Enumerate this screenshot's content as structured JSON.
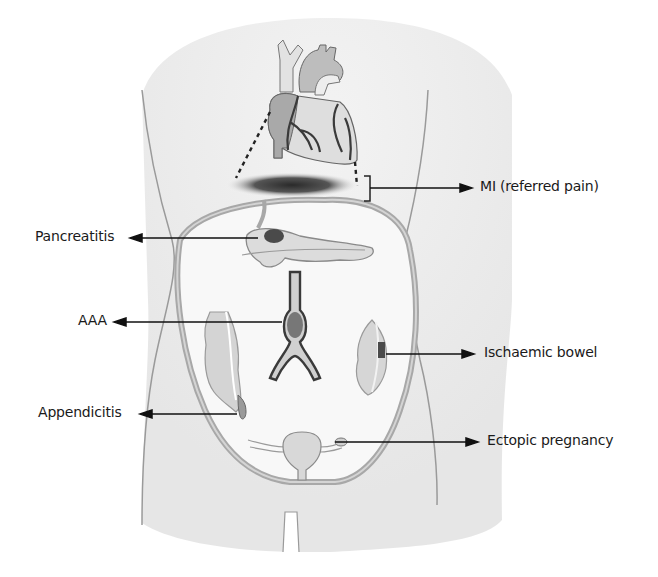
{
  "figure": {
    "labels": {
      "mi": "MI (referred pain)",
      "pancreatitis": "Pancreatitis",
      "aaa": "AAA",
      "ischaemic_bowel": "Ischaemic bowel",
      "appendicitis": "Appendicitis",
      "ectopic_pregnancy": "Ectopic pregnancy"
    },
    "colors": {
      "body_fill": "#ececec",
      "body_outline": "#9a9a9a",
      "abdomen_fill": "#f7f7f7",
      "peritoneum": "#a8a8a8",
      "organ_fill": "#d8d8d8",
      "lesion": "#4a4a4a",
      "arrow": "#111111"
    }
  }
}
